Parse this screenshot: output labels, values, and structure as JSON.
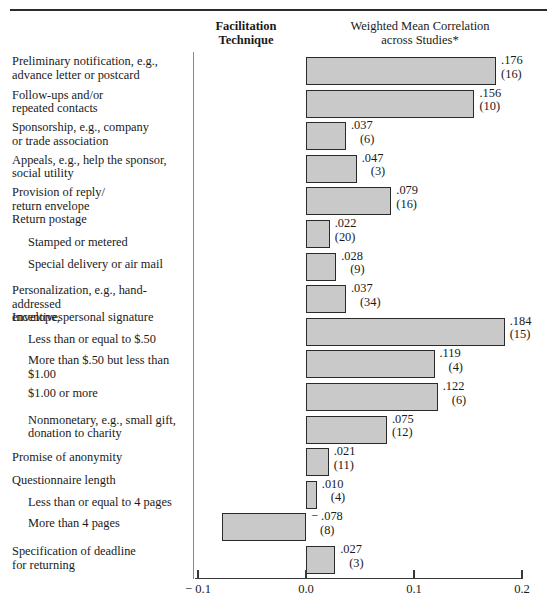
{
  "headers": {
    "facilitation_line1": "Facilitation",
    "facilitation_line2": "Technique",
    "weighted_line1": "Weighted Mean Correlation",
    "weighted_line2": "across Studies*"
  },
  "chart_data": {
    "type": "bar",
    "orientation": "horizontal",
    "title": "Weighted Mean Correlation across Studies*",
    "xlabel": "",
    "ylabel": "Facilitation Technique",
    "xlim": [
      -0.1,
      0.2
    ],
    "grid": false,
    "legend": null,
    "tick_labels": [
      "− 0.1",
      "0.0",
      "0.1",
      "0.2"
    ],
    "tick_values": [
      -0.1,
      0.0,
      0.1,
      0.2
    ],
    "categories": [
      "Preliminary notification, e.g., advance letter or postcard",
      "Follow-ups and/or repeated contacts",
      "Sponsorship, e.g., company or trade association",
      "Appeals, e.g., help the sponsor, social utility",
      "Provision of reply/ return envelope",
      "Return postage — Stamped or metered",
      "Return postage — Special delivery or air mail",
      "Personalization, e.g., hand-addressed envelope, personal signature",
      "Incentives — Less than or equal to $.50",
      "Incentives — More than $.50 but less than $1.00",
      "Incentives — $1.00 or more",
      "Incentives — Nonmonetary, e.g., small gift, donation to charity",
      "Promise of anonymity",
      "Questionnaire length — Less than or equal to 4 pages",
      "Questionnaire length — More than 4 pages",
      "Specification of deadline for returning"
    ],
    "values": [
      0.176,
      0.156,
      0.037,
      0.047,
      0.079,
      0.022,
      0.028,
      0.037,
      0.184,
      0.119,
      0.122,
      0.075,
      0.021,
      0.01,
      -0.078,
      0.027
    ],
    "study_counts": [
      16,
      10,
      6,
      3,
      16,
      20,
      9,
      34,
      15,
      4,
      6,
      12,
      11,
      4,
      8,
      3
    ],
    "value_labels": [
      ".176",
      ".156",
      ".037",
      ".047",
      ".079",
      ".022",
      ".028",
      ".037",
      ".184",
      ".119",
      ".122",
      ".075",
      ".021",
      ".010",
      "− .078",
      ".027"
    ],
    "count_labels": [
      "(16)",
      "(10)",
      "(6)",
      "(3)",
      "(16)",
      "(20)",
      "(9)",
      "(34)",
      "(15)",
      "(4)",
      "(6)",
      "(12)",
      "(11)",
      "(4)",
      "(8)",
      "(3)"
    ]
  },
  "rows": [
    {
      "label_line1": "Preliminary notification, e.g.,",
      "label_line2": "advance letter or postcard",
      "indent": false,
      "value_label": ".176",
      "count_label": "(16)"
    },
    {
      "label_line1": "Follow-ups and/or",
      "label_line2": "repeated contacts",
      "indent": false,
      "value_label": ".156",
      "count_label": "(10)"
    },
    {
      "label_line1": "Sponsorship, e.g., company",
      "label_line2": "or trade association",
      "indent": false,
      "value_label": ".037",
      "count_label": "(6)"
    },
    {
      "label_line1": "Appeals, e.g., help the sponsor,",
      "label_line2": "social utility",
      "indent": false,
      "value_label": ".047",
      "count_label": "(3)"
    },
    {
      "label_line1": "Provision of reply/",
      "label_line2": "return envelope",
      "indent": false,
      "value_label": ".079",
      "count_label": "(16)"
    },
    {
      "label_line1": "Return postage",
      "label_line2": "Stamped or metered",
      "indent": false,
      "value_label": ".022",
      "count_label": "(20)"
    },
    {
      "label_line1": "Special delivery or air mail",
      "label_line2": "",
      "indent": true,
      "value_label": ".028",
      "count_label": "(9)"
    },
    {
      "label_line1": "Personalization, e.g., hand-addressed",
      "label_line2": "envelope, personal signature",
      "indent": false,
      "value_label": ".037",
      "count_label": "(34)"
    },
    {
      "label_line1": "Incentives",
      "label_line2": "Less than or equal to $.50",
      "indent": false,
      "value_label": ".184",
      "count_label": "(15)"
    },
    {
      "label_line1": "More than $.50 but less than $1.00",
      "label_line2": "",
      "indent": true,
      "value_label": ".119",
      "count_label": "(4)"
    },
    {
      "label_line1": "$1.00 or more",
      "label_line2": "",
      "indent": true,
      "value_label": ".122",
      "count_label": "(6)"
    },
    {
      "label_line1": "Nonmonetary, e.g., small gift,",
      "label_line2": "donation to charity",
      "indent": true,
      "value_label": ".075",
      "count_label": "(12)"
    },
    {
      "label_line1": "Promise of anonymity",
      "label_line2": "",
      "indent": false,
      "value_label": ".021",
      "count_label": "(11)"
    },
    {
      "label_line1": "Questionnaire length",
      "label_line2": "Less than or equal to 4 pages",
      "indent": false,
      "value_label": ".010",
      "count_label": "(4)"
    },
    {
      "label_line1": "More than 4 pages",
      "label_line2": "",
      "indent": true,
      "value_label": "− .078",
      "count_label": "(8)"
    },
    {
      "label_line1": "Specification of deadline",
      "label_line2": "for returning",
      "indent": false,
      "value_label": ".027",
      "count_label": "(3)"
    }
  ],
  "axis": {
    "ticks": [
      {
        "label": "− 0.1",
        "value": -0.1
      },
      {
        "label": "0.0",
        "value": 0.0
      },
      {
        "label": "0.1",
        "value": 0.1
      },
      {
        "label": "0.2",
        "value": 0.2
      }
    ]
  },
  "colors": {
    "bar_fill": "#c9c9c9",
    "bar_stroke": "#2a2a2a",
    "rule": "#2b2b2b",
    "divider": "#8a8a8a",
    "text": "#1a1a1a"
  }
}
